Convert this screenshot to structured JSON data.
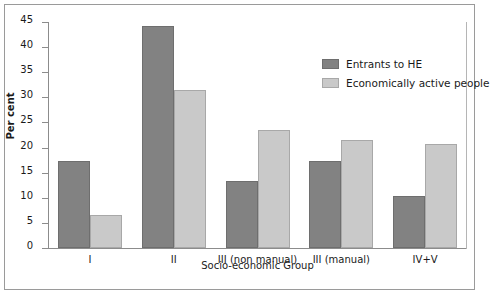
{
  "chart_data": {
    "type": "bar",
    "title": "",
    "xlabel": "Socio-economic Group",
    "ylabel": "Per cent",
    "categories": [
      "I",
      "II",
      "III (non manual)",
      "III (manual)",
      "IV+V"
    ],
    "series": [
      {
        "name": "Entrants to HE",
        "color": "#828282",
        "values": [
          17.3,
          44.2,
          13.3,
          17.4,
          10.3
        ]
      },
      {
        "name": "Economically active people",
        "color": "#c9c9c9",
        "values": [
          6.5,
          31.4,
          23.4,
          21.6,
          20.8
        ]
      }
    ],
    "ylim": [
      0,
      45
    ],
    "yticks": [
      0,
      5,
      10,
      15,
      20,
      25,
      30,
      35,
      40,
      45
    ],
    "ytick_labels": [
      "0",
      "5",
      "10",
      "15",
      "20",
      "25",
      "30",
      "35",
      "40",
      "45"
    ],
    "grid": false,
    "legend_position": "top-right"
  }
}
